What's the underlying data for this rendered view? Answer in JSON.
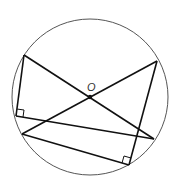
{
  "diagram": {
    "type": "geometry",
    "colors": {
      "stroke": "#111111",
      "circle": "#555555",
      "background": "#ffffff"
    },
    "circle": {
      "cx": 90,
      "cy": 97,
      "r": 78
    },
    "center": {
      "label": "O",
      "x": 90,
      "y": 97,
      "label_x": 88,
      "label_y": 91
    },
    "points": {
      "A": [
        24,
        55
      ],
      "B": [
        157,
        61
      ],
      "C": [
        154,
        139
      ],
      "D": [
        22,
        134
      ],
      "E": [
        16,
        116
      ],
      "F": [
        129,
        165
      ]
    },
    "segments": [
      {
        "name": "diameter-ac",
        "from": "A",
        "to": "C"
      },
      {
        "name": "diameter-bd",
        "from": "B",
        "to": "D"
      },
      {
        "name": "segment-ae",
        "from": "A",
        "to": "E"
      },
      {
        "name": "segment-ec",
        "from": "E",
        "to": "C"
      },
      {
        "name": "segment-bf",
        "from": "B",
        "to": "F"
      },
      {
        "name": "segment-df",
        "from": "D",
        "to": "F"
      }
    ],
    "right_angles": [
      {
        "at": "E"
      },
      {
        "at": "F"
      }
    ]
  }
}
